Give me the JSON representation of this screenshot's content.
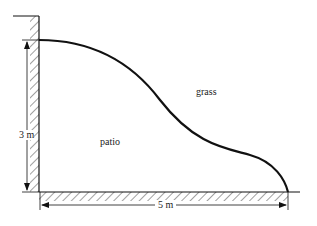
{
  "diagram": {
    "labels": {
      "height": "3 m",
      "width": "5 m",
      "region_grass": "grass",
      "region_patio": "patio"
    },
    "colors": {
      "line": "#111111",
      "hatch": "#333333",
      "background": "#ffffff"
    }
  }
}
